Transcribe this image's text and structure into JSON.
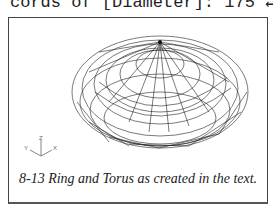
{
  "top_text": "cords of [Diameter]: 175 ↵",
  "figure": {
    "caption": "8-13 Ring and Torus as created in the text.",
    "axes": {
      "z": "Z",
      "y": "Y",
      "x": "X"
    }
  }
}
